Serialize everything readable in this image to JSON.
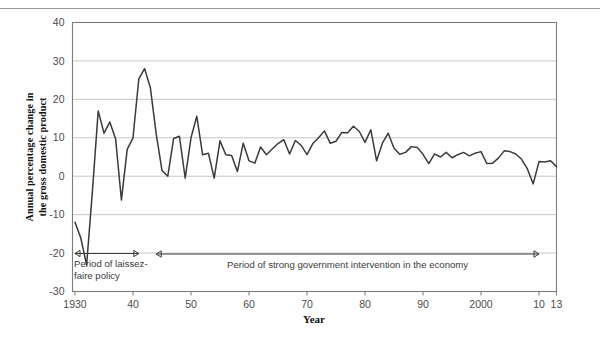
{
  "chart_data": {
    "type": "line",
    "title": "",
    "xlabel": "Year",
    "ylabel": "Annual percentage change in the gross domestic product",
    "xlim": [
      1930,
      2013
    ],
    "ylim": [
      -30,
      40
    ],
    "ytick_values": [
      40,
      30,
      20,
      10,
      0,
      -10,
      -20,
      -30
    ],
    "ytick_labels": [
      "40",
      "30",
      "20",
      "10",
      "0",
      "-10",
      "-20",
      "-30"
    ],
    "xtick_values": [
      1930,
      1940,
      1950,
      1960,
      1970,
      1980,
      1990,
      2000,
      2010,
      2013
    ],
    "xtick_labels": [
      "1930",
      "40",
      "50",
      "60",
      "70",
      "80",
      "90",
      "2000",
      "10",
      "13"
    ],
    "grid": "horizontal",
    "legend": "none",
    "line_color": "#3a3a3a",
    "grid_color": "#b9b9b9",
    "frame_color": "#7d7d7d",
    "x": [
      1930,
      1931,
      1932,
      1933,
      1934,
      1935,
      1936,
      1937,
      1938,
      1939,
      1940,
      1941,
      1942,
      1943,
      1944,
      1945,
      1946,
      1947,
      1948,
      1949,
      1950,
      1951,
      1952,
      1953,
      1954,
      1955,
      1956,
      1957,
      1958,
      1959,
      1960,
      1961,
      1962,
      1963,
      1964,
      1965,
      1966,
      1967,
      1968,
      1969,
      1970,
      1971,
      1972,
      1973,
      1974,
      1975,
      1976,
      1977,
      1978,
      1979,
      1980,
      1981,
      1982,
      1983,
      1984,
      1985,
      1986,
      1987,
      1988,
      1989,
      1990,
      1991,
      1992,
      1993,
      1994,
      1995,
      1996,
      1997,
      1998,
      1999,
      2000,
      2001,
      2002,
      2003,
      2004,
      2005,
      2006,
      2007,
      2008,
      2009,
      2010,
      2011,
      2012,
      2013
    ],
    "values": [
      -12.0,
      -16.1,
      -23.1,
      -4.0,
      17.0,
      11.2,
      14.1,
      9.7,
      -6.2,
      7.0,
      10.0,
      25.3,
      28.0,
      23.0,
      11.0,
      1.5,
      0.0,
      9.8,
      10.4,
      -0.5,
      10.0,
      15.6,
      5.6,
      6.0,
      -0.5,
      9.2,
      5.6,
      5.4,
      1.2,
      8.6,
      4.0,
      3.4,
      7.6,
      5.6,
      7.1,
      8.5,
      9.5,
      5.8,
      9.3,
      8.0,
      5.6,
      8.5,
      10.0,
      11.8,
      8.6,
      9.1,
      11.4,
      11.3,
      13.0,
      11.7,
      8.8,
      12.1,
      4.0,
      8.6,
      11.2,
      7.3,
      5.7,
      6.2,
      7.7,
      7.5,
      5.7,
      3.3,
      5.8,
      5.0,
      6.2,
      4.8,
      5.6,
      6.2,
      5.3,
      6.0,
      6.4,
      3.3,
      3.4,
      4.7,
      6.6,
      6.4,
      5.8,
      4.4,
      1.9,
      -2.0,
      3.8,
      3.7,
      4.0,
      2.5
    ]
  },
  "annotations": {
    "laissez_faire": {
      "line1": "Period of laissez-",
      "line2": "faire policy",
      "start_year": 1930,
      "end_year": 1941,
      "arrow_style": "double"
    },
    "intervention": {
      "line1": "Period of strong government intervention in the economy",
      "start_year": 1944,
      "end_year": 2010,
      "arrow_style": "double"
    }
  }
}
